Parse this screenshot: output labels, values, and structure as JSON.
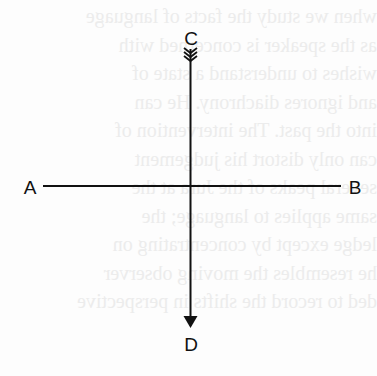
{
  "diagram": {
    "type": "axes-with-arrows",
    "labels": {
      "a": "A",
      "b": "B",
      "c": "C",
      "d": "D"
    },
    "colors": {
      "line": "#111111",
      "background": "#fdfdfd",
      "bleed_text": "#ececec"
    }
  },
  "bleed_through": {
    "lines": [
      "when we study the facts of language",
      "as the speaker is concerned with",
      "wishes to understand a state of",
      "and ignores diachrony. He can",
      "into the past. The intervention of",
      "can only distort his judgement",
      "several peaks of the Jura at the",
      "same applies to language; the",
      "ledge except by concentrating on",
      "he resembles the moving observer",
      "ded to record the shifts in perspective"
    ]
  }
}
